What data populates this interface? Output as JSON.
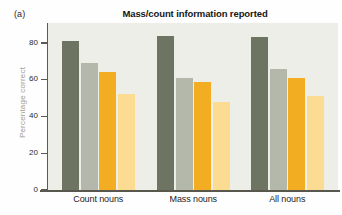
{
  "panel": {
    "label": "(a)"
  },
  "chart_data": {
    "type": "bar",
    "title": "Mass/count information reported",
    "xlabel": "",
    "ylabel": "Percentage correct",
    "ylim": [
      0,
      90
    ],
    "ytick_values": [
      0,
      20,
      40,
      60,
      80
    ],
    "ytick_labels": [
      "0",
      "20",
      "40",
      "60",
      "80"
    ],
    "grid": false,
    "legend_position": "none",
    "categories": [
      "Count nouns",
      "Mass nouns",
      "All nouns"
    ],
    "series": [
      {
        "name": "series-1",
        "color": "#6e7462",
        "values": [
          81,
          84,
          83
        ]
      },
      {
        "name": "series-2",
        "color": "#b4b8ab",
        "values": [
          69,
          61,
          66
        ]
      },
      {
        "name": "series-3",
        "color": "#f2ad22",
        "values": [
          64,
          59,
          61
        ]
      },
      {
        "name": "series-4",
        "color": "#fbdc92",
        "values": [
          52,
          48,
          51
        ]
      }
    ]
  },
  "colors": {
    "plot_background": "#eeeee8",
    "axis": "#58584f",
    "title_text": "#161616",
    "axis_label_text": "#9d9d95"
  }
}
